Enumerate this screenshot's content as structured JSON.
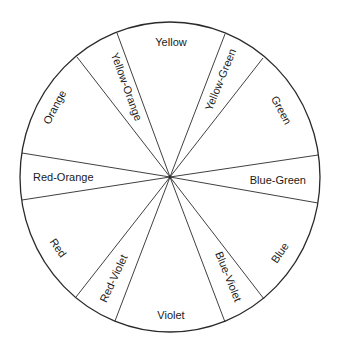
{
  "diagram": {
    "segments": [
      {
        "name": "Yellow",
        "label": "Yellow"
      },
      {
        "name": "Yellow-Green",
        "label": "Yellow-Green"
      },
      {
        "name": "Green",
        "label": "Green"
      },
      {
        "name": "Blue-Green",
        "label": "Blue-Green"
      },
      {
        "name": "Blue",
        "label": "Blue"
      },
      {
        "name": "Blue-Violet",
        "label": "Blue-Violet"
      },
      {
        "name": "Violet",
        "label": "Violet"
      },
      {
        "name": "Red-Violet",
        "label": "Red-Violet"
      },
      {
        "name": "Red",
        "label": "Red"
      },
      {
        "name": "Red-Orange",
        "label": "Red-Orange"
      },
      {
        "name": "Orange",
        "label": "Orange"
      },
      {
        "name": "Yellow-Orange",
        "label": "Yellow-Orange"
      }
    ],
    "colors": {
      "line": "#2a2a2a",
      "background": "#ffffff",
      "text": "#1a1a1a"
    }
  }
}
